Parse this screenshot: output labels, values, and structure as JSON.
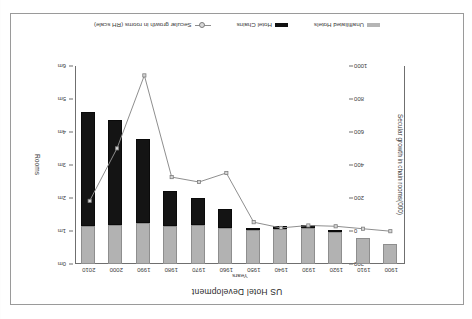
{
  "page": {
    "bleed_text": "",
    "rotation_note": ""
  },
  "chart": {
    "title": "US Hotel Development",
    "legend": [
      {
        "label": "Unaffiliated Hotels",
        "marker": "square-swatch-gray",
        "color": "#b2b2b2"
      },
      {
        "label": "Hotel Chains",
        "marker": "square-swatch-black",
        "color": "#141414"
      },
      {
        "label": "Secular growth in rooms (RH scale)",
        "marker": "line-marker-icon",
        "color": "#8d8d8d"
      }
    ],
    "x_axis_title": "Years",
    "y_left_title": "Secular growth in chain rooms(000)",
    "y_right_title": "Rooms"
  },
  "chart_data": {
    "type": "bar",
    "title": "US Hotel Development",
    "xlabel": "Years",
    "ylabel": "Rooms",
    "y2label": "Secular growth in chain rooms(000)",
    "grid": false,
    "legend_position": "bottom",
    "categories": [
      "1900",
      "1910",
      "1920",
      "1930",
      "1940",
      "1950",
      "1960",
      "1970",
      "1980",
      "1990",
      "2000",
      "2010"
    ],
    "y_right_ticks": [
      "0m",
      "1m",
      "2m",
      "3m",
      "4m",
      "5m",
      "6m"
    ],
    "y_right_lim": [
      0,
      6000
    ],
    "y_left_ticks": [
      "-200",
      "0",
      "200",
      "400",
      "600",
      "800",
      "1000"
    ],
    "y_left_lim": [
      -200,
      1000
    ],
    "series": [
      {
        "name": "Unaffiliated Hotels",
        "type": "bar-stack",
        "color": "#b2b2b2",
        "unit": "rooms (000)",
        "values": [
          600,
          790,
          960,
          1080,
          1070,
          1040,
          1100,
          1180,
          1150,
          1230,
          1180,
          1160
        ]
      },
      {
        "name": "Hotel Chains",
        "type": "bar-stack",
        "color": "#141414",
        "unit": "rooms (000)",
        "values": [
          0,
          0,
          70,
          90,
          90,
          60,
          560,
          830,
          1050,
          2560,
          3190,
          3460
        ]
      },
      {
        "name": "Secular growth in rooms (RH scale)",
        "type": "line",
        "color": "#8d8d8d",
        "unit": "000 rooms",
        "values": [
          0,
          15,
          30,
          35,
          20,
          55,
          355,
          300,
          330,
          950,
          505,
          185
        ]
      }
    ]
  }
}
